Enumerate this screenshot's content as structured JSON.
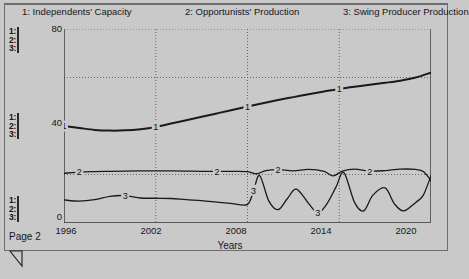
{
  "page": {
    "footer_label": "Page 2",
    "background_color": "#c9c9c9",
    "line_color": "#1a1a1a",
    "grid_color": "#5a5a5a"
  },
  "legend": {
    "entries": [
      {
        "key": "1",
        "label": "1: Independents' Capacity"
      },
      {
        "key": "2",
        "label": "2: Opportunists' Production"
      },
      {
        "key": "3",
        "label": "3: Swing Producer Production"
      }
    ]
  },
  "selectors": {
    "groups": [
      {
        "name": "top",
        "items": [
          "1:",
          "2:",
          "3:"
        ]
      },
      {
        "name": "middle",
        "items": [
          "1:",
          "2:",
          "3:"
        ]
      },
      {
        "name": "bottom",
        "items": [
          "1:",
          "2:",
          "3:"
        ]
      }
    ]
  },
  "chart_data": {
    "type": "line",
    "title": "",
    "xlabel": "Years",
    "ylabel": "",
    "xlim": [
      1996,
      2020
    ],
    "ylim": [
      0,
      80
    ],
    "xticks": [
      1996,
      2002,
      2008,
      2014,
      2020
    ],
    "xticklabels": [
      "1996",
      "2002",
      "2008",
      "2014",
      "2020"
    ],
    "yticks": [
      0,
      40,
      80
    ],
    "yticklabels": [
      "0",
      "40",
      "80"
    ],
    "ygridlines": [
      20,
      60,
      80
    ],
    "grid": true,
    "legend_position": "top",
    "series": [
      {
        "name": "Independents' Capacity",
        "key": "1",
        "inline_labels": [
          "1",
          "1",
          "1",
          "1"
        ],
        "x": [
          1996,
          1997,
          1998,
          1999,
          2000,
          2001,
          2002,
          2003,
          2004,
          2005,
          2006,
          2007,
          2008,
          2009,
          2010,
          2011,
          2012,
          2013,
          2014,
          2015,
          2016,
          2017,
          2018,
          2019,
          2020
        ],
        "y": [
          40.0,
          39.2,
          38.4,
          38.1,
          38.2,
          38.7,
          39.6,
          41.0,
          42.4,
          43.8,
          45.2,
          46.6,
          48.0,
          49.4,
          50.7,
          51.9,
          53.1,
          54.2,
          55.3,
          56.2,
          57.0,
          57.8,
          58.7,
          60.0,
          62.0
        ]
      },
      {
        "name": "Opportunists' Production",
        "key": "2",
        "inline_labels": [
          "2",
          "2",
          "2",
          "2"
        ],
        "x": [
          1996,
          1997,
          1998,
          1999,
          2000,
          2001,
          2002,
          2003,
          2004,
          2005,
          2006,
          2007,
          2008,
          2008.6,
          2009.2,
          2010,
          2011,
          2012,
          2013,
          2013.6,
          2014.2,
          2015,
          2016,
          2017,
          2018,
          2019,
          2019.5,
          2020
        ],
        "y": [
          20.5,
          21.0,
          21.2,
          21.3,
          21.4,
          21.5,
          21.5,
          21.5,
          21.4,
          21.3,
          21.3,
          21.3,
          21.2,
          20.3,
          21.6,
          22.0,
          21.5,
          22.1,
          21.3,
          19.4,
          21.4,
          22.2,
          21.4,
          21.6,
          22.2,
          22.1,
          21.2,
          17.5
        ]
      },
      {
        "name": "Swing Producer Production",
        "key": "3",
        "inline_labels": [
          "3",
          "3",
          "3"
        ],
        "x": [
          1996,
          1997,
          1998,
          1999,
          2000,
          2001,
          2002,
          2003,
          2004,
          2005,
          2006,
          2007,
          2008,
          2008.4,
          2008.8,
          2009.4,
          2010,
          2010.6,
          2011.2,
          2012,
          2012.6,
          2013.2,
          2013.8,
          2014.3,
          2015,
          2015.6,
          2016.2,
          2017,
          2017.6,
          2018.2,
          2019,
          2019.5,
          2020
        ],
        "y": [
          9.5,
          9.0,
          9.6,
          11.0,
          11.3,
          10.3,
          10.2,
          10.1,
          9.6,
          9.2,
          8.6,
          8.0,
          7.7,
          13.5,
          19.5,
          9.0,
          5.5,
          10.0,
          14.0,
          8.0,
          4.2,
          8.0,
          15.0,
          20.8,
          8.5,
          5.0,
          11.5,
          14.5,
          8.0,
          5.0,
          8.5,
          11.5,
          19.5
        ]
      }
    ]
  },
  "icons": {
    "corner_fold": "corner-fold-icon"
  }
}
